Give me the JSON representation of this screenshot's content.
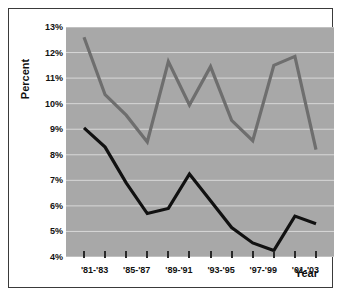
{
  "axes": {
    "ylabel": "Percent",
    "xlabel": "Year",
    "yticks": [
      "4%",
      "5%",
      "6%",
      "7%",
      "8%",
      "9%",
      "10%",
      "11%",
      "12%",
      "13%"
    ],
    "xticklabels": [
      "'81-'83",
      "'85-'87",
      "'89-'91",
      "'93-'95",
      "'97-'99",
      "'01-'03"
    ]
  },
  "colors": {
    "plot_background": "#a8a8a8",
    "gridline": "#d8d8d8",
    "series_upper": "#6e6e6e",
    "series_lower": "#111111",
    "frame_border": "#3a3a3a",
    "text": "#111111"
  },
  "chart_data": {
    "type": "line",
    "title": "",
    "xlabel": "Year",
    "ylabel": "Percent",
    "ylim": [
      4,
      13
    ],
    "grid": true,
    "legend": "none",
    "x": [
      "'81-'83",
      "'83-'85",
      "'85-'87",
      "'87-'89",
      "'89-'91",
      "'91-'93",
      "'93-'95",
      "'95-'97",
      "'97-'99",
      "'99-'01",
      "'01-'03",
      "'03-'05"
    ],
    "xticklabels_shown": [
      "'81-'83",
      "'85-'87",
      "'89-'91",
      "'93-'95",
      "'97-'99",
      "'01-'03"
    ],
    "yticks": [
      4,
      5,
      6,
      7,
      8,
      9,
      10,
      11,
      12,
      13
    ],
    "series": [
      {
        "name": "upper-series",
        "color": "#6e6e6e",
        "values": [
          12.6,
          10.35,
          9.55,
          8.5,
          11.65,
          9.95,
          11.45,
          9.35,
          8.55,
          11.5,
          11.85,
          8.2
        ]
      },
      {
        "name": "lower-series",
        "color": "#111111",
        "values": [
          9.05,
          8.3,
          6.9,
          5.7,
          5.9,
          7.25,
          6.2,
          5.15,
          4.55,
          4.25,
          5.6,
          5.3
        ]
      }
    ]
  }
}
